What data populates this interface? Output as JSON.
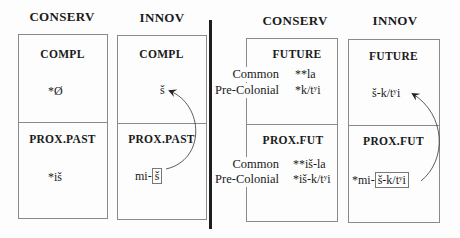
{
  "left_panel": {
    "columns": [
      {
        "header": "CONSERV",
        "top_label": "COMPL",
        "top_form": "*Ø",
        "bottom_label": "PROX.PAST",
        "bottom_form": "*iš"
      },
      {
        "header": "INNOV",
        "top_label": "COMPL",
        "top_form": "š",
        "bottom_label": "PROX.PAST",
        "bottom_prefix": "mi-",
        "bottom_boxed": "š"
      }
    ]
  },
  "right_panel": {
    "columns": [
      {
        "header": "CONSERV",
        "top_label": "FUTURE",
        "bottom_label": "PROX.FUT",
        "top_rows": [
          {
            "label": "Common",
            "form": "**la"
          },
          {
            "label": "Pre-Colonial",
            "form": "*k/tʸi"
          }
        ],
        "bottom_rows": [
          {
            "label": "Common",
            "form": "**iš-la"
          },
          {
            "label": "Pre-Colonial",
            "form": "*iš-k/tʸi"
          }
        ]
      },
      {
        "header": "INNOV",
        "top_label": "FUTURE",
        "top_form": "š-k/tʸi",
        "bottom_label": "PROX.FUT",
        "bottom_prefix": "*mi-",
        "bottom_boxed": "š-k/tʸi"
      }
    ]
  },
  "arrows": [
    {
      "from": "mi-š (boxed)",
      "to": "š",
      "panel": "left"
    },
    {
      "from": "š-k/tʸi (boxed)",
      "to": "š-k/tʸi",
      "panel": "right"
    }
  ]
}
